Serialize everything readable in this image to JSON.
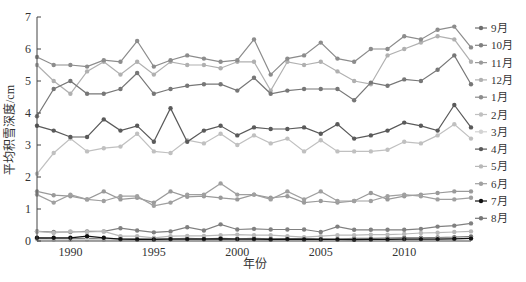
{
  "chart_data": {
    "type": "line",
    "title": "",
    "xlabel": "年份",
    "ylabel": "平均积雪深度/cm",
    "ylim": [
      0,
      7
    ],
    "xlim": [
      1988,
      2014
    ],
    "yticks": [
      0,
      1,
      2,
      3,
      4,
      5,
      6,
      7
    ],
    "xticks": [
      1990,
      1995,
      2000,
      2005,
      2010
    ],
    "grid": false,
    "legend_position": "right",
    "x": [
      1988,
      1989,
      1990,
      1991,
      1992,
      1993,
      1994,
      1995,
      1996,
      1997,
      1998,
      1999,
      2000,
      2001,
      2002,
      2003,
      2004,
      2005,
      2006,
      2007,
      2008,
      2009,
      2010,
      2011,
      2012,
      2013,
      2014
    ],
    "series": [
      {
        "name": "9月",
        "color": "#6e6e6e",
        "values": [
          0.08,
          0.07,
          0.07,
          0.08,
          0.06,
          0.07,
          0.07,
          0.06,
          0.07,
          0.08,
          0.07,
          0.08,
          0.07,
          0.08,
          0.07,
          0.07,
          0.08,
          0.07,
          0.06,
          0.08,
          0.08,
          0.09,
          0.1,
          0.1,
          0.11,
          0.12,
          0.14
        ]
      },
      {
        "name": "10月",
        "color": "#808080",
        "values": [
          0.3,
          0.28,
          0.28,
          0.3,
          0.3,
          0.4,
          0.33,
          0.27,
          0.3,
          0.43,
          0.33,
          0.52,
          0.36,
          0.38,
          0.36,
          0.36,
          0.36,
          0.28,
          0.45,
          0.35,
          0.35,
          0.35,
          0.35,
          0.38,
          0.45,
          0.48,
          0.55
        ]
      },
      {
        "name": "11月",
        "color": "#9a9a9a",
        "values": [
          1.55,
          1.43,
          1.4,
          1.3,
          1.55,
          1.3,
          1.35,
          1.2,
          1.55,
          1.38,
          1.4,
          1.35,
          1.3,
          1.45,
          1.35,
          1.4,
          1.2,
          1.25,
          1.2,
          1.25,
          1.5,
          1.3,
          1.4,
          1.45,
          1.5,
          1.55,
          1.55
        ]
      },
      {
        "name": "12月",
        "color": "#b0b0b0",
        "values": [
          5.5,
          5.0,
          4.6,
          5.3,
          5.6,
          5.2,
          5.6,
          5.2,
          5.6,
          5.5,
          5.5,
          5.4,
          5.6,
          5.6,
          4.7,
          5.6,
          5.5,
          5.6,
          5.3,
          5.0,
          4.9,
          5.8,
          6.0,
          6.2,
          6.4,
          6.3,
          5.6
        ]
      },
      {
        "name": "1月",
        "color": "#8c8c8c",
        "values": [
          5.75,
          5.5,
          5.5,
          5.45,
          5.65,
          5.6,
          6.25,
          5.45,
          5.65,
          5.8,
          5.7,
          5.6,
          5.65,
          6.3,
          5.2,
          5.7,
          5.8,
          6.2,
          5.7,
          5.6,
          6.0,
          6.0,
          6.4,
          6.3,
          6.6,
          6.7,
          6.05
        ]
      },
      {
        "name": "2月",
        "color": "#c0c0c0",
        "values": [
          2.1,
          2.75,
          3.2,
          2.8,
          2.9,
          2.95,
          3.35,
          2.8,
          2.75,
          3.15,
          3.05,
          3.35,
          3.0,
          3.3,
          3.05,
          3.2,
          2.8,
          3.15,
          2.8,
          2.8,
          2.8,
          2.85,
          3.1,
          3.05,
          3.3,
          3.65,
          3.2
        ]
      },
      {
        "name": "3月",
        "color": "#d3d3d3",
        "values": [
          0.05,
          0.04,
          0.04,
          0.05,
          0.04,
          0.04,
          0.05,
          0.04,
          0.05,
          0.05,
          0.04,
          0.05,
          0.05,
          0.05,
          0.04,
          0.05,
          0.04,
          0.05,
          0.05,
          0.05,
          0.05,
          0.06,
          0.06,
          0.07,
          0.08,
          0.08,
          0.09
        ]
      },
      {
        "name": "4月",
        "color": "#5a5a5a",
        "values": [
          3.6,
          3.45,
          3.25,
          3.25,
          3.8,
          3.45,
          3.6,
          3.1,
          4.15,
          3.1,
          3.45,
          3.6,
          3.3,
          3.55,
          3.5,
          3.5,
          3.55,
          3.35,
          3.65,
          3.2,
          3.3,
          3.45,
          3.7,
          3.6,
          3.45,
          4.25,
          3.55
        ]
      },
      {
        "name": "5月",
        "color": "#b8b8b8",
        "values": [
          0.3,
          0.25,
          0.3,
          0.28,
          0.3,
          0.15,
          0.15,
          0.1,
          0.15,
          0.16,
          0.16,
          0.18,
          0.2,
          0.18,
          0.18,
          0.15,
          0.12,
          0.15,
          0.18,
          0.18,
          0.2,
          0.2,
          0.22,
          0.25,
          0.26,
          0.28,
          0.3
        ]
      },
      {
        "name": "6月",
        "color": "#a0a0a0",
        "values": [
          1.45,
          1.2,
          1.45,
          1.3,
          1.25,
          1.4,
          1.4,
          1.1,
          1.2,
          1.45,
          1.45,
          1.8,
          1.45,
          1.45,
          1.3,
          1.55,
          1.3,
          1.55,
          1.25,
          1.25,
          1.25,
          1.4,
          1.45,
          1.4,
          1.3,
          1.3,
          1.35
        ]
      },
      {
        "name": "7月",
        "color": "#111111",
        "values": [
          0.1,
          0.1,
          0.1,
          0.15,
          0.1,
          0.06,
          0.05,
          0.05,
          0.06,
          0.06,
          0.06,
          0.07,
          0.06,
          0.06,
          0.05,
          0.06,
          0.05,
          0.05,
          0.05,
          0.04,
          0.05,
          0.05,
          0.06,
          0.06,
          0.06,
          0.07,
          0.08
        ]
      },
      {
        "name": "8月",
        "color": "#777777",
        "values": [
          3.9,
          4.75,
          5.0,
          4.6,
          4.6,
          4.75,
          5.25,
          4.6,
          4.75,
          4.85,
          4.9,
          4.9,
          4.7,
          5.1,
          4.6,
          4.7,
          4.75,
          4.75,
          4.75,
          4.4,
          4.95,
          4.85,
          5.05,
          5.0,
          5.35,
          5.8,
          4.9
        ]
      }
    ]
  },
  "legend": {
    "items": [
      "9月",
      "10月",
      "11月",
      "12月",
      "1月",
      "2月",
      "3月",
      "4月",
      "5月",
      "6月",
      "7月",
      "8月"
    ]
  },
  "axes": {
    "xlabel": "年份",
    "ylabel": "平均积雪深度/cm"
  }
}
